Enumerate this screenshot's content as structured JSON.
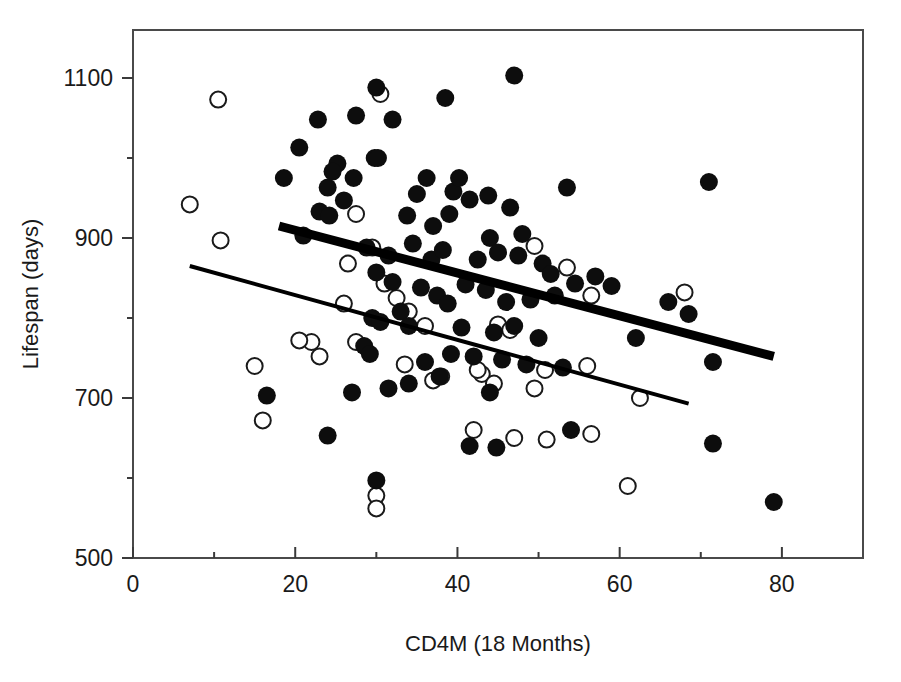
{
  "chart_data": {
    "type": "scatter",
    "title": "",
    "xlabel": "CD4M (18 Months)",
    "ylabel": "Lifespan (days)",
    "xlim": [
      0,
      90
    ],
    "ylim": [
      500,
      1160
    ],
    "xticks": [
      0,
      20,
      40,
      60,
      80
    ],
    "yticks": [
      500,
      700,
      900,
      1100
    ],
    "xtick_labels": [
      "0",
      "20",
      "40",
      "60",
      "80"
    ],
    "ytick_labels": [
      "500",
      "700",
      "900",
      "1100"
    ],
    "minor_xticks": [
      10,
      30,
      50,
      70
    ],
    "minor_yticks": [
      600,
      800,
      1000
    ],
    "grid": false,
    "legend": "none",
    "colors": {
      "filled_marker": "#0d0d0d",
      "open_marker_stroke": "#1a1a1a",
      "open_marker_fill": "#ffffff",
      "fit_line": "#000000",
      "frame": "#4a4a4a"
    },
    "series": [
      {
        "name": "filled",
        "marker": "filled-circle",
        "points": [
          [
            30.0,
            1088
          ],
          [
            38.5,
            1075
          ],
          [
            47.0,
            1103
          ],
          [
            22.8,
            1048
          ],
          [
            27.5,
            1053
          ],
          [
            32.0,
            1048
          ],
          [
            20.5,
            1013
          ],
          [
            25.2,
            993
          ],
          [
            29.8,
            1000
          ],
          [
            18.6,
            975
          ],
          [
            24.0,
            963
          ],
          [
            24.6,
            983
          ],
          [
            27.2,
            975
          ],
          [
            30.2,
            1000
          ],
          [
            35.0,
            955
          ],
          [
            36.2,
            975
          ],
          [
            39.5,
            958
          ],
          [
            40.2,
            975
          ],
          [
            43.8,
            953
          ],
          [
            46.5,
            938
          ],
          [
            53.5,
            963
          ],
          [
            71.0,
            970
          ],
          [
            23.0,
            933
          ],
          [
            24.2,
            928
          ],
          [
            26.0,
            947
          ],
          [
            33.8,
            928
          ],
          [
            37.0,
            915
          ],
          [
            39.0,
            930
          ],
          [
            41.5,
            948
          ],
          [
            44.0,
            900
          ],
          [
            48.0,
            905
          ],
          [
            21.0,
            903
          ],
          [
            28.8,
            888
          ],
          [
            31.5,
            878
          ],
          [
            34.5,
            893
          ],
          [
            36.8,
            873
          ],
          [
            38.2,
            885
          ],
          [
            42.5,
            873
          ],
          [
            45.0,
            882
          ],
          [
            47.5,
            878
          ],
          [
            50.5,
            868
          ],
          [
            51.5,
            855
          ],
          [
            54.5,
            843
          ],
          [
            57.0,
            852
          ],
          [
            59.0,
            840
          ],
          [
            30.0,
            857
          ],
          [
            32.0,
            845
          ],
          [
            35.5,
            838
          ],
          [
            37.5,
            828
          ],
          [
            41.0,
            842
          ],
          [
            43.5,
            835
          ],
          [
            46.0,
            820
          ],
          [
            49.0,
            823
          ],
          [
            52.0,
            828
          ],
          [
            66.0,
            820
          ],
          [
            68.5,
            805
          ],
          [
            29.5,
            800
          ],
          [
            30.5,
            795
          ],
          [
            33.0,
            808
          ],
          [
            34.0,
            790
          ],
          [
            38.8,
            818
          ],
          [
            40.5,
            788
          ],
          [
            44.5,
            782
          ],
          [
            47.0,
            790
          ],
          [
            50.0,
            775
          ],
          [
            62.0,
            775
          ],
          [
            71.5,
            745
          ],
          [
            28.5,
            765
          ],
          [
            29.2,
            755
          ],
          [
            36.0,
            745
          ],
          [
            39.2,
            755
          ],
          [
            42.0,
            752
          ],
          [
            45.5,
            748
          ],
          [
            48.5,
            742
          ],
          [
            53.0,
            738
          ],
          [
            16.5,
            703
          ],
          [
            27.0,
            707
          ],
          [
            31.5,
            712
          ],
          [
            34.0,
            718
          ],
          [
            37.8,
            727
          ],
          [
            44.0,
            707
          ],
          [
            24.0,
            653
          ],
          [
            41.5,
            640
          ],
          [
            44.8,
            638
          ],
          [
            54.0,
            660
          ],
          [
            71.5,
            643
          ],
          [
            30.0,
            597
          ],
          [
            79.0,
            570
          ]
        ]
      },
      {
        "name": "open",
        "marker": "open-circle",
        "points": [
          [
            10.5,
            1073
          ],
          [
            30.5,
            1080
          ],
          [
            7.0,
            942
          ],
          [
            10.8,
            897
          ],
          [
            27.5,
            930
          ],
          [
            29.5,
            888
          ],
          [
            26.5,
            868
          ],
          [
            49.5,
            890
          ],
          [
            53.5,
            863
          ],
          [
            56.5,
            828
          ],
          [
            68.0,
            832
          ],
          [
            31.0,
            843
          ],
          [
            32.5,
            825
          ],
          [
            26.0,
            818
          ],
          [
            34.0,
            808
          ],
          [
            36.0,
            790
          ],
          [
            45.0,
            792
          ],
          [
            46.5,
            785
          ],
          [
            15.0,
            740
          ],
          [
            22.0,
            770
          ],
          [
            23.0,
            752
          ],
          [
            27.5,
            770
          ],
          [
            33.5,
            742
          ],
          [
            37.0,
            722
          ],
          [
            38.0,
            727
          ],
          [
            43.0,
            730
          ],
          [
            44.5,
            718
          ],
          [
            49.5,
            712
          ],
          [
            62.5,
            700
          ],
          [
            16.0,
            672
          ],
          [
            42.0,
            660
          ],
          [
            47.0,
            650
          ],
          [
            51.0,
            648
          ],
          [
            56.5,
            655
          ],
          [
            61.0,
            590
          ],
          [
            30.0,
            578
          ],
          [
            30.0,
            562
          ],
          [
            20.5,
            772
          ],
          [
            42.5,
            735
          ],
          [
            50.8,
            735
          ],
          [
            56.0,
            740
          ]
        ]
      }
    ],
    "fit_lines": [
      {
        "name": "filled-group-fit",
        "style": "thick",
        "x_start": 18.0,
        "y_start": 915,
        "x_end": 79.0,
        "y_end": 752
      },
      {
        "name": "open-group-fit",
        "style": "thin",
        "x_start": 7.0,
        "y_start": 865,
        "x_end": 68.5,
        "y_end": 693
      }
    ]
  },
  "axes": {
    "x_title": "CD4M (18 Months)",
    "y_title": "Lifespan (days)",
    "x_tick_labels": [
      "0",
      "20",
      "40",
      "60",
      "80"
    ],
    "y_tick_labels": [
      "500",
      "700",
      "900",
      "1100"
    ]
  }
}
